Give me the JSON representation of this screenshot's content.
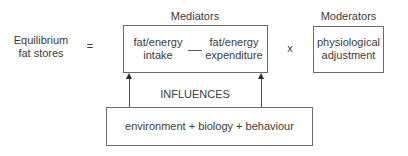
{
  "diagram": {
    "lhs": {
      "line1": "Equilibrium",
      "line2": "fat stores"
    },
    "equals": "=",
    "mediators": {
      "title": "Mediators",
      "intake": {
        "line1": "fat/energy",
        "line2": "intake"
      },
      "operator": "—",
      "expenditure": {
        "line1": "fat/energy",
        "line2": "expenditure"
      }
    },
    "multiply": "x",
    "moderators": {
      "title": "Moderators",
      "content": {
        "line1": "physiological",
        "line2": "adjustment"
      }
    },
    "influences_label": "INFLUENCES",
    "influences_box": "environment + biology + behaviour"
  }
}
